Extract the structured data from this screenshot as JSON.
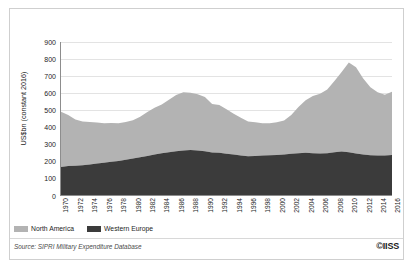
{
  "figure": {
    "source_note": "Source: SIPRI Military Expenditure Database",
    "logo": "©IISS"
  },
  "legend": {
    "position": "bottom-left",
    "items": [
      {
        "label": "North America",
        "color": "#b3b3b3",
        "swatch_name": "legend-swatch-north-america"
      },
      {
        "label": "Western Europe",
        "color": "#3b3b3b",
        "swatch_name": "legend-swatch-western-europe"
      }
    ]
  },
  "chart_data": {
    "type": "area",
    "stacked": true,
    "title": "",
    "subtitle": "",
    "xlabel": "",
    "ylabel": "US$bn (constant 2016)",
    "ylim": [
      0,
      900
    ],
    "yticks": [
      0,
      100,
      200,
      300,
      400,
      500,
      600,
      700,
      800,
      900
    ],
    "ytick_labels": [
      "0",
      "100",
      "200",
      "300",
      "400",
      "500",
      "600",
      "700",
      "800",
      "900"
    ],
    "grid": true,
    "grid_axis": "y",
    "xlim": [
      1970,
      2016
    ],
    "xticks": [
      1970,
      1972,
      1974,
      1976,
      1978,
      1980,
      1982,
      1984,
      1986,
      1988,
      1990,
      1992,
      1994,
      1996,
      1998,
      2000,
      2002,
      2004,
      2006,
      2008,
      2010,
      2012,
      2014,
      2016
    ],
    "xtick_labels": [
      "1970",
      "1972",
      "1974",
      "1976",
      "1978",
      "1980",
      "1982",
      "1984",
      "1986",
      "1988",
      "1990",
      "1992",
      "1994",
      "1996",
      "1998",
      "2000",
      "2002",
      "2004",
      "2006",
      "2008",
      "2010",
      "2012",
      "2014",
      "2016"
    ],
    "x": [
      1970,
      1971,
      1972,
      1973,
      1974,
      1975,
      1976,
      1977,
      1978,
      1979,
      1980,
      1981,
      1982,
      1983,
      1984,
      1985,
      1986,
      1987,
      1988,
      1989,
      1990,
      1991,
      1992,
      1993,
      1994,
      1995,
      1996,
      1997,
      1998,
      1999,
      2000,
      2001,
      2002,
      2003,
      2004,
      2005,
      2006,
      2007,
      2008,
      2009,
      2010,
      2011,
      2012,
      2013,
      2014,
      2015,
      2016
    ],
    "series": [
      {
        "name": "Western Europe",
        "color": "#3b3b3b",
        "values": [
          165,
          170,
          172,
          175,
          180,
          185,
          190,
          195,
          200,
          208,
          215,
          222,
          230,
          238,
          245,
          252,
          258,
          262,
          265,
          262,
          258,
          250,
          248,
          242,
          238,
          232,
          228,
          230,
          232,
          234,
          236,
          238,
          242,
          246,
          248,
          246,
          244,
          246,
          252,
          256,
          252,
          244,
          238,
          234,
          232,
          232,
          236
        ]
      },
      {
        "name": "North America",
        "color": "#b3b3b3",
        "values": [
          325,
          300,
          272,
          258,
          250,
          242,
          232,
          228,
          222,
          222,
          225,
          238,
          258,
          275,
          288,
          308,
          330,
          342,
          336,
          330,
          318,
          285,
          282,
          262,
          240,
          222,
          205,
          198,
          190,
          188,
          192,
          200,
          228,
          272,
          310,
          336,
          352,
          374,
          418,
          468,
          528,
          508,
          448,
          400,
          372,
          358,
          372
        ]
      }
    ],
    "totals": [
      490,
      470,
      444,
      433,
      430,
      427,
      422,
      423,
      422,
      430,
      440,
      460,
      488,
      513,
      533,
      560,
      588,
      604,
      601,
      592,
      576,
      535,
      530,
      504,
      478,
      454,
      433,
      428,
      422,
      422,
      428,
      438,
      470,
      518,
      558,
      582,
      596,
      620,
      670,
      724,
      780,
      752,
      686,
      634,
      604,
      590,
      608
    ],
    "annotations": [
      {
        "text": "Peak total ≈ 780 in 2010"
      },
      {
        "text": "Trough total ≈ 422 in 1998-1999"
      }
    ]
  }
}
